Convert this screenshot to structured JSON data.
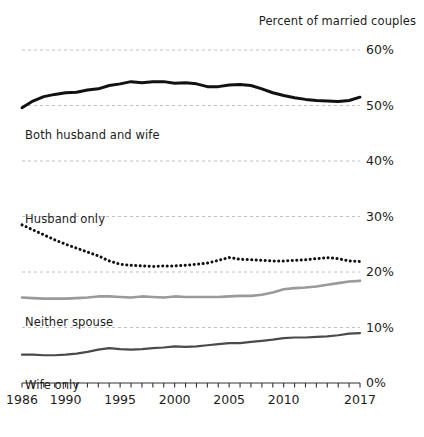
{
  "chart_data": {
    "type": "line",
    "title": "Percent of married couples",
    "xlabel": "",
    "ylabel": "",
    "xlim": [
      1986,
      2017
    ],
    "ylim": [
      0,
      60
    ],
    "grid": true,
    "grid_axis": "y",
    "legend_position": "inline-labels",
    "ytick_labels": [
      "60%",
      "50%",
      "40%",
      "30%",
      "20%",
      "10%",
      "0%"
    ],
    "ytick_values": [
      60,
      50,
      40,
      30,
      20,
      10,
      0
    ],
    "xtick_labels": [
      "1986",
      "1990",
      "1995",
      "2000",
      "2005",
      "2010",
      "2017"
    ],
    "xtick_values": [
      1986,
      1990,
      1995,
      2000,
      2005,
      2010,
      2017
    ],
    "x": [
      1986,
      1987,
      1988,
      1989,
      1990,
      1991,
      1992,
      1993,
      1994,
      1995,
      1996,
      1997,
      1998,
      1999,
      2000,
      2001,
      2002,
      2003,
      2004,
      2005,
      2006,
      2007,
      2008,
      2009,
      2010,
      2011,
      2012,
      2013,
      2014,
      2015,
      2016,
      2017
    ],
    "series": [
      {
        "name": "Both husband and wife",
        "style": "solid-thick",
        "color": "#111111",
        "values": [
          49.6,
          50.8,
          51.6,
          52.0,
          52.3,
          52.4,
          52.8,
          53.0,
          53.6,
          53.9,
          54.3,
          54.1,
          54.3,
          54.3,
          54.0,
          54.1,
          53.9,
          53.4,
          53.4,
          53.7,
          53.8,
          53.6,
          53.0,
          52.3,
          51.8,
          51.4,
          51.1,
          50.9,
          50.8,
          50.7,
          50.9,
          51.5
        ]
      },
      {
        "name": "Husband only",
        "style": "dotted",
        "color": "#111111",
        "values": [
          28.5,
          27.6,
          26.7,
          25.8,
          25.0,
          24.3,
          23.6,
          22.9,
          22.0,
          21.4,
          21.2,
          21.1,
          21.0,
          21.1,
          21.1,
          21.2,
          21.4,
          21.6,
          22.1,
          22.6,
          22.3,
          22.2,
          22.1,
          22.0,
          22.0,
          22.1,
          22.2,
          22.4,
          22.6,
          22.4,
          22.0,
          21.9
        ]
      },
      {
        "name": "Neither spouse",
        "style": "solid-gray",
        "color": "#9a9a9a",
        "values": [
          15.4,
          15.3,
          15.2,
          15.2,
          15.2,
          15.3,
          15.4,
          15.6,
          15.6,
          15.5,
          15.4,
          15.6,
          15.5,
          15.4,
          15.6,
          15.5,
          15.5,
          15.5,
          15.5,
          15.6,
          15.7,
          15.7,
          15.9,
          16.3,
          16.9,
          17.1,
          17.2,
          17.4,
          17.7,
          18.0,
          18.3,
          18.4
        ]
      },
      {
        "name": "Wife only",
        "style": "solid-medium",
        "color": "#4a4a4a",
        "values": [
          5.1,
          5.1,
          5.0,
          5.0,
          5.1,
          5.3,
          5.6,
          6.0,
          6.3,
          6.1,
          6.0,
          6.1,
          6.3,
          6.4,
          6.6,
          6.5,
          6.6,
          6.8,
          7.0,
          7.2,
          7.2,
          7.4,
          7.6,
          7.8,
          8.1,
          8.2,
          8.2,
          8.3,
          8.4,
          8.6,
          8.9,
          9.0
        ]
      }
    ],
    "annotations": [
      {
        "text": "Both husband and wife",
        "x_px": 25,
        "y_px": 128
      },
      {
        "text": "Husband only",
        "x_px": 25,
        "y_px": 212
      },
      {
        "text": "Neither spouse",
        "x_px": 25,
        "y_px": 315
      },
      {
        "text": "Wife only",
        "x_px": 25,
        "y_px": 378
      }
    ]
  }
}
